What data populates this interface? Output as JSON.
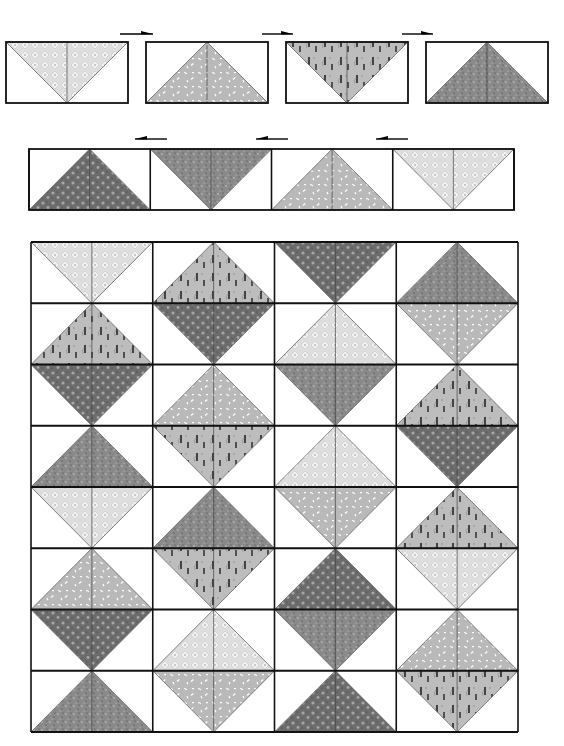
{
  "diagram": {
    "type": "quilt-assembly"
  },
  "fabrics": {
    "A": {
      "name": "light-diamond-print",
      "base": "#dedede",
      "accent": "#f4f4f4",
      "mark": "#c8c8c8"
    },
    "B": {
      "name": "light-medium-dash-print",
      "base": "#b9b9b9",
      "accent": "#ffffff",
      "mark": "#9a9a9a"
    },
    "C": {
      "name": "medium-squiggle-print",
      "base": "#bdbdbd",
      "accent": "#222222",
      "mark": "#8c8c8c"
    },
    "D": {
      "name": "medium-dark-speckle-print",
      "base": "#8a8a8a",
      "accent": "#d8d8d8",
      "mark": "#3a3a3a"
    },
    "E": {
      "name": "dark-spot-print",
      "base": "#6c6c6c",
      "accent": "#a6a6a6",
      "mark": "#3c3c3c"
    }
  },
  "step1_row": {
    "blocks": [
      {
        "fabric": "A",
        "orientation": "down"
      },
      {
        "fabric": "B",
        "orientation": "up"
      },
      {
        "fabric": "C",
        "orientation": "down"
      },
      {
        "fabric": "D",
        "orientation": "up"
      }
    ],
    "arrows": [
      {
        "direction": "right"
      },
      {
        "direction": "right"
      },
      {
        "direction": "right"
      }
    ]
  },
  "step2_row": {
    "blocks": [
      {
        "fabric": "E",
        "orientation": "up"
      },
      {
        "fabric": "D",
        "orientation": "down"
      },
      {
        "fabric": "B",
        "orientation": "up"
      },
      {
        "fabric": "A",
        "orientation": "down"
      }
    ],
    "arrows": [
      {
        "direction": "left"
      },
      {
        "direction": "left"
      },
      {
        "direction": "left"
      }
    ]
  },
  "quilt_grid": {
    "rows": 8,
    "cols": 4,
    "cells": [
      [
        [
          "A",
          "down"
        ],
        [
          "C",
          "up"
        ],
        [
          "E",
          "down"
        ],
        [
          "D",
          "up"
        ]
      ],
      [
        [
          "C",
          "up"
        ],
        [
          "E",
          "down"
        ],
        [
          "A",
          "up"
        ],
        [
          "B",
          "down"
        ]
      ],
      [
        [
          "E",
          "down"
        ],
        [
          "B",
          "up"
        ],
        [
          "D",
          "down"
        ],
        [
          "C",
          "up"
        ]
      ],
      [
        [
          "D",
          "up"
        ],
        [
          "C",
          "down"
        ],
        [
          "A",
          "up"
        ],
        [
          "E",
          "down"
        ]
      ],
      [
        [
          "A",
          "down"
        ],
        [
          "D",
          "up"
        ],
        [
          "B",
          "down"
        ],
        [
          "C",
          "up"
        ]
      ],
      [
        [
          "B",
          "up"
        ],
        [
          "C",
          "down"
        ],
        [
          "E",
          "up"
        ],
        [
          "A",
          "down"
        ]
      ],
      [
        [
          "E",
          "down"
        ],
        [
          "A",
          "up"
        ],
        [
          "D",
          "down"
        ],
        [
          "B",
          "up"
        ]
      ],
      [
        [
          "D",
          "up"
        ],
        [
          "B",
          "down"
        ],
        [
          "E",
          "up"
        ],
        [
          "C",
          "down"
        ]
      ]
    ]
  }
}
